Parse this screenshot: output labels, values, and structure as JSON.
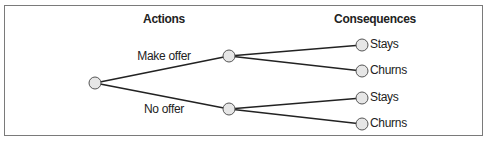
{
  "headers": {
    "actions": "Actions",
    "consequences": "Consequences"
  },
  "actions": [
    {
      "label": "Make offer"
    },
    {
      "label": "No offer"
    }
  ],
  "consequences": [
    {
      "label": "Stays"
    },
    {
      "label": "Churns"
    },
    {
      "label": "Stays"
    },
    {
      "label": "Churns"
    }
  ],
  "colors": {
    "node_fill": "#e6e6e6",
    "node_stroke": "#555555",
    "edge": "#222222",
    "border": "#7a7a7a"
  }
}
